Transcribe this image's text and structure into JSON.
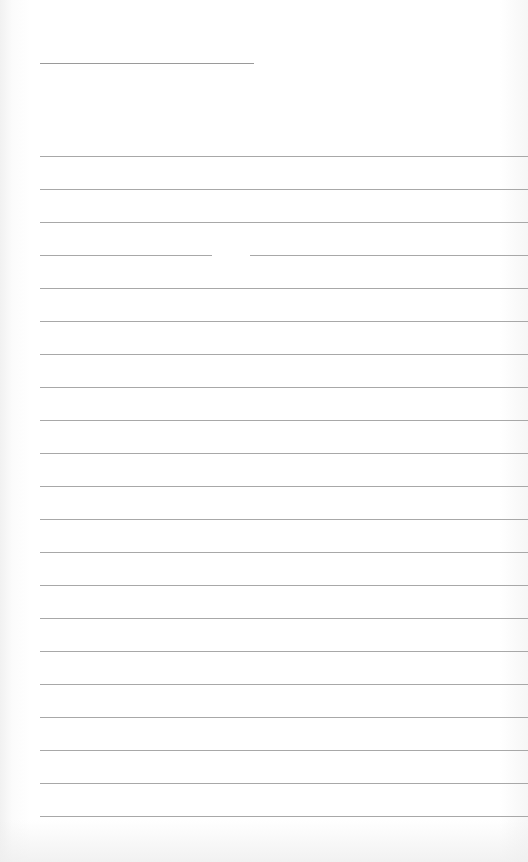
{
  "document": {
    "type": "lined-paper",
    "header_line": {
      "x": 40,
      "y": 63,
      "width": 214
    },
    "ruled_lines": {
      "count": 21,
      "start_y": 156,
      "spacing": 33,
      "x": 40,
      "width": 488
    },
    "line_gap": {
      "line_index": 3,
      "x": 212,
      "width": 38
    },
    "colors": {
      "paper": "#ffffff",
      "line": "#a8a8a8",
      "header_line": "#9a9a9a"
    }
  }
}
